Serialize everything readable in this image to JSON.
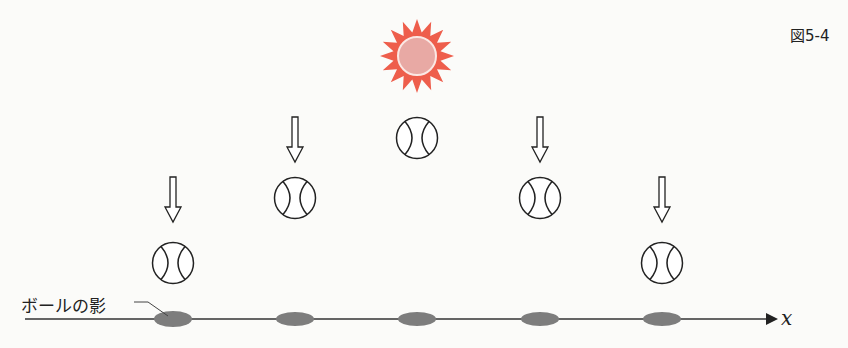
{
  "figure": {
    "label": "図5-4",
    "shadow_label": "ボールの影",
    "axis_label": "x"
  },
  "colors": {
    "sun_rays": "#ee5e4c",
    "sun_core": "#e8a9a4",
    "shadow": "#7d7d7d",
    "line": "#333333"
  },
  "scene": {
    "sun": {
      "cx": 417,
      "cy": 56
    },
    "axis": {
      "y": 319,
      "x_start": 25,
      "x_end": 775
    },
    "balls": [
      {
        "cx": 173,
        "cy": 263,
        "has_arrow": true
      },
      {
        "cx": 295,
        "cy": 198,
        "has_arrow": true
      },
      {
        "cx": 417,
        "cy": 138,
        "has_arrow": false
      },
      {
        "cx": 540,
        "cy": 198,
        "has_arrow": true
      },
      {
        "cx": 662,
        "cy": 263,
        "has_arrow": true
      }
    ]
  }
}
